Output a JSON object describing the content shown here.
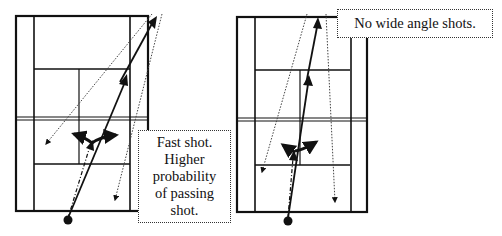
{
  "diagrams": [
    {
      "id": "left-court",
      "caption_lines": [
        "Fast shot.",
        "Higher",
        "probability",
        "of passing",
        "shot."
      ]
    },
    {
      "id": "right-court",
      "caption_lines": [
        "No wide angle shots."
      ]
    }
  ],
  "colors": {
    "lines": "#111111",
    "background": "#ffffff",
    "dotted": "#444444"
  },
  "legend": {
    "solid_arrow": "shot path",
    "dotted_arrow": "possible passing shot",
    "dash_dot_line": "player approach",
    "filled_circle": "player start position",
    "bold_curved_arrows": "player move options"
  }
}
